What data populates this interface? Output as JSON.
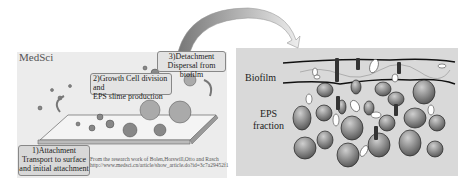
{
  "left_figure": {
    "watermark": "MedSci",
    "stages": [
      {
        "id": "1",
        "title": "1)Attachment",
        "description": "Transport to surface and initial attachment"
      },
      {
        "id": "2",
        "title": "2)Growth Cell division and",
        "description": "EPS slime production"
      },
      {
        "id": "3",
        "title": "3)Detachment",
        "description": "Dispersal from biofilm"
      }
    ],
    "credit_line1": "From the research work of Bolen,Horswill,Otto and Rasch",
    "credit_line2": "http://www.medsci.cn/article/show_article.do?id=3c7a29452f1"
  },
  "right_figure": {
    "labels": {
      "biofilm": "Biofilm",
      "eps_line1": "EPS",
      "eps_line2": "fraction"
    }
  },
  "colors": {
    "panel_bg": "#ececec",
    "right_bg": "#d9d9d9",
    "sphere": "#777777",
    "outline": "#111111"
  }
}
